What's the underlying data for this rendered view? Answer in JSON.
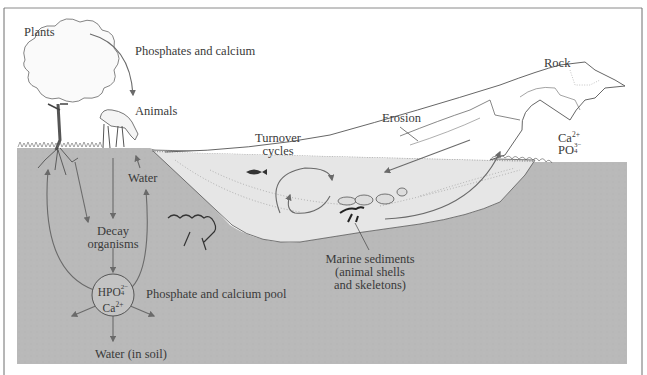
{
  "figure": {
    "colors": {
      "ground": "#b9b9b9",
      "water": "#e4e4e4",
      "frame": "#6e6e6e",
      "ink": "#3a3a3a",
      "arrow": "#6a6a6a"
    }
  },
  "labels": {
    "plants": "Plants",
    "phosphates_calcium": "Phosphates and calcium",
    "animals": "Animals",
    "water": "Water",
    "turnover_line1": "Turnover",
    "turnover_line2": "cycles",
    "erosion": "Erosion",
    "rock": "Rock",
    "rock_ion1_base": "Ca",
    "rock_ion1_charge": "2+",
    "rock_ion2_base": "PO",
    "rock_ion2_sup": "3−",
    "rock_ion2_sub": "4",
    "decay_line1": "Decay",
    "decay_line2": "organisms",
    "pool_ion1_base": "HPO",
    "pool_ion1_sup": "2−",
    "pool_ion1_sub": "4",
    "pool_ion2_base": "Ca",
    "pool_ion2_charge": "2+",
    "pool_label": "Phosphate and calcium pool",
    "water_in_soil": "Water (in soil)",
    "marine_line1": "Marine sediments",
    "marine_line2": "(animal shells",
    "marine_line3": "and skeletons)"
  }
}
